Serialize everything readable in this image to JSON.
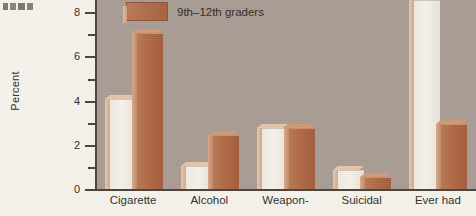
{
  "page": {
    "margin_fragment": "",
    "background_color": "#f3f0ea"
  },
  "chart_data": {
    "type": "bar",
    "title": "",
    "subtitle": "",
    "xlabel": "",
    "ylabel": "Percent",
    "ylim": [
      0,
      8.6
    ],
    "yticks": [
      0,
      2,
      4,
      6,
      8
    ],
    "ytick_labels": [
      "0",
      "2",
      "4",
      "6",
      "8"
    ],
    "minor_ticks": [
      1,
      3,
      5,
      7
    ],
    "grid": false,
    "legend_position": "top-left-inside",
    "categories": [
      "Cigarette",
      "Alcohol",
      "Weapon-",
      "Suicidal",
      "Ever had"
    ],
    "series": [
      {
        "name": "",
        "color": "#f2ece2",
        "values": [
          4.1,
          1.1,
          2.8,
          0.9,
          8.6
        ]
      },
      {
        "name": "9th–12th graders",
        "color": "#ad6b49",
        "values": [
          7.1,
          2.5,
          2.8,
          0.6,
          3.0
        ]
      }
    ],
    "notes": {
      "clipped_bar": "Ever had light bar extends beyond the top of the visible plot area",
      "plot_background": "#a99c94"
    }
  },
  "legend": {
    "entries": [
      {
        "label": "9th–12th graders",
        "color": "#ad6b49"
      }
    ]
  },
  "axis": {
    "y_title": "Percent",
    "y_tick_labels": [
      "8",
      "6",
      "4",
      "2",
      "0"
    ]
  },
  "x_axis": {
    "labels": [
      "Cigarette",
      "Alcohol",
      "Weapon-",
      "Suicidal",
      "Ever had"
    ]
  }
}
